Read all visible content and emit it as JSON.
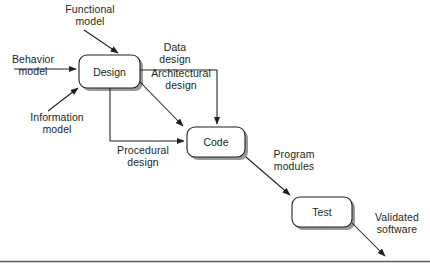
{
  "diagram": {
    "stroke_color": "#231f20",
    "shadow_color": "#9a9a9a",
    "box_fill": "#ffffff",
    "nodes": [
      {
        "id": "design",
        "label": "Design",
        "x": 79,
        "y": 55,
        "w": 61,
        "h": 33
      },
      {
        "id": "code",
        "label": "Code",
        "x": 187,
        "y": 127,
        "w": 58,
        "h": 30
      },
      {
        "id": "test",
        "label": "Test",
        "x": 292,
        "y": 197,
        "w": 60,
        "h": 30
      }
    ],
    "edge_labels": [
      {
        "id": "functional-model",
        "text": "Functional\nmodel",
        "x": 60,
        "y": 3,
        "w": 60
      },
      {
        "id": "behavior-model",
        "text": "Behavior\nmodel",
        "x": 6,
        "y": 53,
        "w": 54
      },
      {
        "id": "information-model",
        "text": "Information\nmodel",
        "x": 23,
        "y": 111,
        "w": 68
      },
      {
        "id": "data-design",
        "text": "Data\ndesign",
        "x": 151,
        "y": 41,
        "w": 48
      },
      {
        "id": "architectural-design",
        "text": "Architectural\ndesign",
        "x": 143,
        "y": 67,
        "w": 76
      },
      {
        "id": "procedural-design",
        "text": "Procedural\ndesign",
        "x": 108,
        "y": 144,
        "w": 70
      },
      {
        "id": "program-modules",
        "text": "Program\nmodules",
        "x": 263,
        "y": 148,
        "w": 62
      },
      {
        "id": "validated-software",
        "text": "Validated\nsoftware",
        "x": 366,
        "y": 211,
        "w": 62
      }
    ],
    "footer_rule": {
      "id": "footer-rule",
      "y": 261
    }
  }
}
